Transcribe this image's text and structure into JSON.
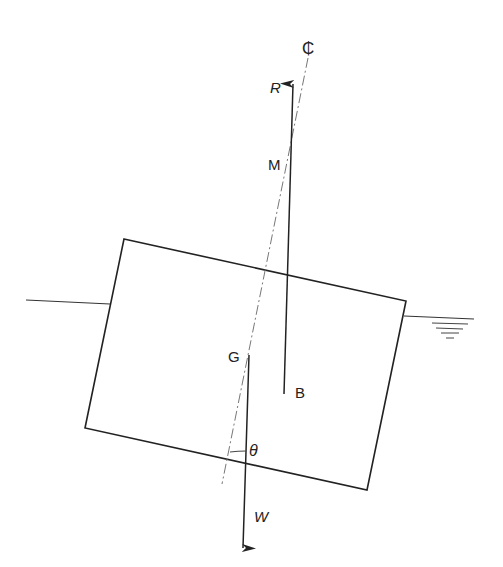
{
  "diagram": {
    "labels": {
      "centerline": "₵",
      "righting_force": "R",
      "metacentre": "M",
      "centre_of_gravity": "G",
      "centre_of_buoyancy": "B",
      "heel_angle": "θ",
      "weight": "W"
    },
    "colors": {
      "line": "#222222",
      "background": "#ffffff"
    }
  }
}
